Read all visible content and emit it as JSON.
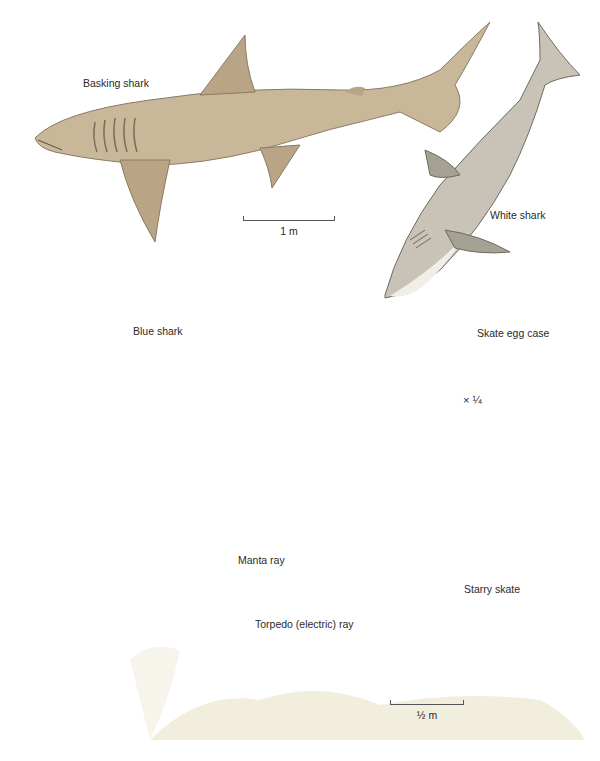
{
  "plate": {
    "background": "#ffffff",
    "labels": {
      "basking_shark": "Basking shark",
      "white_shark": "White shark",
      "blue_shark": "Blue shark",
      "skate_egg_case": "Skate egg case",
      "egg_case_scale": "× ¼",
      "manta_ray": "Manta ray",
      "torpedo_ray": "Torpedo (electric) ray",
      "starry_skate": "Starry skate"
    },
    "scale_bars": {
      "upper": "1 m",
      "lower": "½ m"
    },
    "colors": {
      "basking_shark": "#c9b79a",
      "white_shark": "#bdb8ad",
      "blue_shark": "#3e4f74",
      "manta_ray": "#f2f0e8",
      "manta_head": "#2c2e2c",
      "torpedo_ray": "#7b7771",
      "starry_skate": "#c7a56c",
      "egg_case": "#3a3428",
      "kelp": "#b4bf6a",
      "sand": "#e9e3c8"
    }
  }
}
